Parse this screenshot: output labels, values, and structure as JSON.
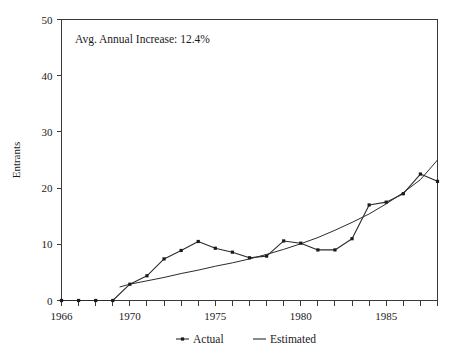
{
  "chart_data": {
    "type": "line",
    "title": "",
    "xlabel": "",
    "ylabel": "Entrants",
    "xlim": [
      1966,
      1988
    ],
    "ylim": [
      0,
      50
    ],
    "grid": false,
    "legend_position": "bottom-center",
    "annotation": "Avg. Annual Increase: 12.4%",
    "x": [
      1966,
      1967,
      1968,
      1969,
      1970,
      1971,
      1972,
      1973,
      1974,
      1975,
      1976,
      1977,
      1978,
      1979,
      1980,
      1981,
      1982,
      1983,
      1984,
      1985,
      1986,
      1987,
      1988
    ],
    "y_tick_labels": [
      "0",
      "10",
      "20",
      "30",
      "40",
      "50"
    ],
    "y_tick_values": [
      0,
      10,
      20,
      30,
      40,
      50
    ],
    "x_tick_labels": [
      "1966",
      "1970",
      "1975",
      "1980",
      "1985"
    ],
    "x_tick_values": [
      1966,
      1970,
      1975,
      1980,
      1985
    ],
    "series": [
      {
        "name": "Actual",
        "marker": "square",
        "x": [
          1966,
          1967,
          1968,
          1969,
          1970,
          1971,
          1972,
          1973,
          1974,
          1975,
          1976,
          1977,
          1978,
          1979,
          1980,
          1981,
          1982,
          1983,
          1984,
          1985,
          1986,
          1987,
          1988
        ],
        "values": [
          0,
          0,
          0,
          0,
          2.9,
          4.4,
          7.4,
          8.9,
          10.5,
          9.3,
          8.6,
          7.6,
          7.9,
          10.6,
          10.2,
          9.0,
          9.0,
          11.0,
          17.0,
          17.5,
          19.0,
          22.5,
          21.2
        ]
      },
      {
        "name": "Estimated",
        "marker": "none",
        "x": [
          1969.4,
          1970,
          1971,
          1972,
          1973,
          1974,
          1975,
          1976,
          1977,
          1978,
          1979,
          1980,
          1981,
          1982,
          1983,
          1984,
          1985,
          1986,
          1987,
          1988
        ],
        "values": [
          2.4,
          2.9,
          3.5,
          4.1,
          4.8,
          5.4,
          6.1,
          6.7,
          7.4,
          8.2,
          9.1,
          10.1,
          11.2,
          12.5,
          13.9,
          15.4,
          17.2,
          19.2,
          21.5,
          25.0
        ]
      }
    ]
  },
  "legend": {
    "items": [
      {
        "label": "Actual"
      },
      {
        "label": "Estimated"
      }
    ]
  }
}
